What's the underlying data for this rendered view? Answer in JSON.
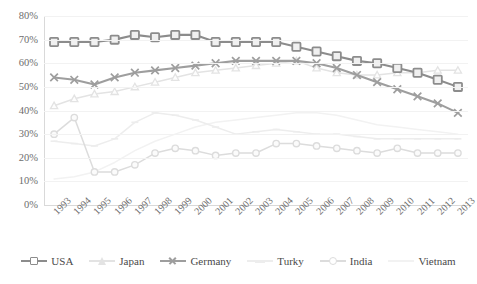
{
  "chart_data": {
    "type": "line",
    "title": "",
    "subtitle": "",
    "xlabel": "",
    "ylabel": "",
    "categories": [
      "1993",
      "1994",
      "1995",
      "1996",
      "1997",
      "1998",
      "1999",
      "2000",
      "2001",
      "2002",
      "2003",
      "2004",
      "2005",
      "2006",
      "2007",
      "2008",
      "2009",
      "2010",
      "2011",
      "2012",
      "2013"
    ],
    "ylim": [
      0,
      80
    ],
    "y_ticks": [
      "0%",
      "10%",
      "20%",
      "30%",
      "40%",
      "50%",
      "60%",
      "70%",
      "80%"
    ],
    "y_tick_values": [
      0,
      10,
      20,
      30,
      40,
      50,
      60,
      70,
      80
    ],
    "grid": true,
    "legend_position": "bottom",
    "series": [
      {
        "name": "USA",
        "marker": "square",
        "color": "#8c8c8c",
        "values": [
          69,
          69,
          69,
          70,
          72,
          71,
          72,
          72,
          69,
          69,
          69,
          69,
          67,
          65,
          63,
          61,
          60,
          58,
          56,
          53,
          50
        ]
      },
      {
        "name": "Japan",
        "marker": "triangle",
        "color": "#e3e3e3",
        "values": [
          42,
          45,
          47,
          48,
          50,
          52,
          54,
          56,
          57,
          58,
          59,
          60,
          61,
          58,
          56,
          55,
          55,
          56,
          56,
          57,
          57
        ]
      },
      {
        "name": "Germany",
        "marker": "x",
        "color": "#9e9e9e",
        "values": [
          54,
          53,
          51,
          54,
          56,
          57,
          58,
          59,
          60,
          61,
          61,
          61,
          61,
          60,
          58,
          55,
          52,
          49,
          46,
          43,
          39
        ]
      },
      {
        "name": "Turky",
        "marker": "dash",
        "color": "#ededed",
        "values": [
          27,
          26,
          25,
          28,
          35,
          39,
          38,
          36,
          33,
          30,
          31,
          32,
          31,
          30,
          30,
          29,
          28,
          28,
          28,
          28,
          28
        ]
      },
      {
        "name": "India",
        "marker": "circle",
        "color": "#dcdcdc",
        "values": [
          30,
          37,
          14,
          14,
          17,
          22,
          24,
          23,
          21,
          22,
          22,
          26,
          26,
          25,
          24,
          23,
          22,
          24,
          22,
          22,
          22
        ]
      },
      {
        "name": "Vietnam",
        "marker": "none",
        "color": "#f2f2f2",
        "values": [
          11,
          12,
          14,
          18,
          23,
          27,
          30,
          33,
          35,
          36,
          37,
          38,
          39,
          39,
          38,
          36,
          34,
          33,
          32,
          31,
          30
        ]
      }
    ]
  }
}
